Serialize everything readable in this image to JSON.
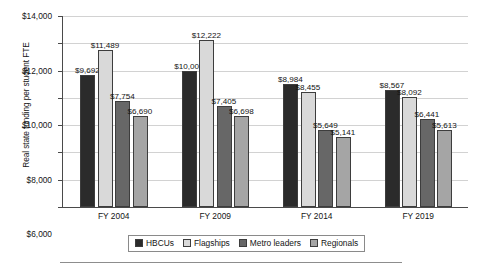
{
  "chart_data": {
    "type": "bar",
    "title": "",
    "subtitle": "",
    "xlabel": "",
    "ylabel": "Real state funding per student FTE",
    "categories": [
      "FY 2004",
      "FY 2009",
      "FY 2014",
      "FY 2019"
    ],
    "series": [
      {
        "name": "HBCUs",
        "color": "#2b2b2b",
        "values": [
          9692,
          10000,
          8984,
          8567
        ],
        "labels": [
          "$9,692",
          "$10,000",
          "$8,984",
          "$8,567"
        ]
      },
      {
        "name": "Flagships",
        "color": "#d9d9d9",
        "values": [
          11489,
          12222,
          8455,
          8092
        ],
        "labels": [
          "$11,489",
          "$12,222",
          "$8,455",
          "$8,092"
        ]
      },
      {
        "name": "Metro leaders",
        "color": "#676767",
        "values": [
          7754,
          7405,
          5649,
          6441
        ],
        "labels": [
          "$7,754",
          "$7,405",
          "$5,649",
          "$6,441"
        ]
      },
      {
        "name": "Regionals",
        "color": "#a5a5a5",
        "values": [
          6690,
          6698,
          5141,
          5613
        ],
        "labels": [
          "$6,690",
          "$6,698",
          "$5,141",
          "$5,613"
        ]
      }
    ],
    "ylim": [
      0,
      14000
    ],
    "yticks": [
      0,
      2000,
      4000,
      6000,
      8000,
      10000,
      12000,
      14000
    ],
    "ytick_labels": [
      "$0",
      "$2,000",
      "$4,000",
      "$6,000",
      "$8,000",
      "$10,000",
      "$12,000",
      "$14,000"
    ],
    "grid": true,
    "legend_position": "bottom"
  },
  "legend": {
    "items": [
      {
        "label": "HBCUs",
        "color": "#2b2b2b"
      },
      {
        "label": "Flagships",
        "color": "#d9d9d9"
      },
      {
        "label": "Metro leaders",
        "color": "#676767"
      },
      {
        "label": "Regionals",
        "color": "#a5a5a5"
      }
    ]
  }
}
